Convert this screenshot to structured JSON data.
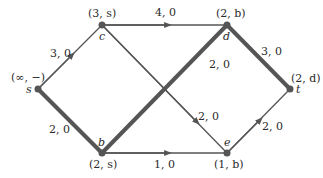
{
  "diagram": {
    "type": "network-flow-graph",
    "nodes": [
      {
        "id": "s",
        "name": "s",
        "label": "(∞, −)",
        "x": 38,
        "y": 89
      },
      {
        "id": "c",
        "name": "c",
        "label": "(3, s)",
        "x": 102,
        "y": 25
      },
      {
        "id": "d",
        "name": "d",
        "label": "(2, b)",
        "x": 227,
        "y": 25
      },
      {
        "id": "t",
        "name": "t",
        "label": "(2, d)",
        "x": 290,
        "y": 89
      },
      {
        "id": "b",
        "name": "b",
        "label": "(2, s)",
        "x": 102,
        "y": 153
      },
      {
        "id": "e",
        "name": "e",
        "label": "(1, b)",
        "x": 227,
        "y": 153
      }
    ],
    "edges": [
      {
        "from": "s",
        "to": "c",
        "label": "3, 0",
        "highlighted": false
      },
      {
        "from": "c",
        "to": "d",
        "label": "4, 0",
        "highlighted": false
      },
      {
        "from": "c",
        "to": "e",
        "label": "2, 0",
        "highlighted": false
      },
      {
        "from": "s",
        "to": "b",
        "label": "2, 0",
        "highlighted": true
      },
      {
        "from": "b",
        "to": "d",
        "label": "2, 0",
        "highlighted": true
      },
      {
        "from": "d",
        "to": "t",
        "label": "3, 0",
        "highlighted": true
      },
      {
        "from": "b",
        "to": "e",
        "label": "1, 0",
        "highlighted": false
      },
      {
        "from": "e",
        "to": "t",
        "label": "2, 0",
        "highlighted": false
      }
    ]
  }
}
